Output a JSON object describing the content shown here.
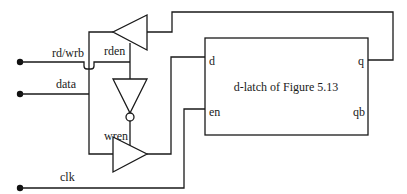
{
  "diagram": {
    "type": "circuit-schematic",
    "inputs": {
      "rd_wrb": "rd/wrb",
      "data": "data",
      "clk": "clk"
    },
    "gates": {
      "read_buffer_label": "rden",
      "write_buffer_label": "wren"
    },
    "latch": {
      "title": "d-latch of Figure 5.13",
      "port_d": "d",
      "port_en": "en",
      "port_q": "q",
      "port_qb": "qb"
    },
    "colors": {
      "line": "#1a1a1a",
      "background": "#ffffff"
    }
  }
}
